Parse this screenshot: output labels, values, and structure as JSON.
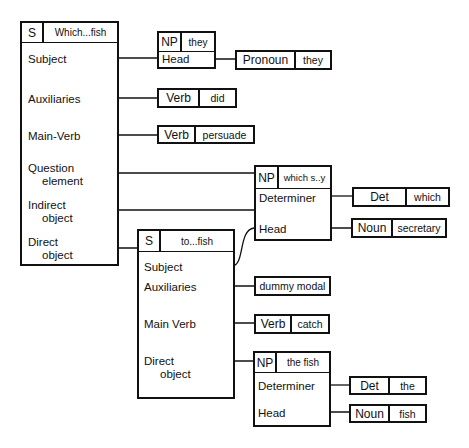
{
  "diagram": {
    "main_clause": {
      "tag": "S",
      "value": "Which...fish",
      "slots": [
        {
          "label": "Subject"
        },
        {
          "label": "Auxiliaries"
        },
        {
          "label": "Main-Verb"
        },
        {
          "label_line1": "Question",
          "label_line2": "element"
        },
        {
          "label_line1": "Indirect",
          "label_line2": "object"
        },
        {
          "label_line1": "Direct",
          "label_line2": "object"
        }
      ]
    },
    "np_they": {
      "tag": "NP",
      "value": "they",
      "slot": "Head",
      "filler": {
        "category": "Pronoun",
        "word": "they"
      }
    },
    "aux_filler": {
      "category": "Verb",
      "word": "did"
    },
    "main_verb_filler": {
      "category": "Verb",
      "word": "persuade"
    },
    "np_which": {
      "tag": "NP",
      "value": "which s..y",
      "slots": [
        {
          "label": "Determiner",
          "filler": {
            "category": "Det",
            "word": "which"
          }
        },
        {
          "label": "Head",
          "filler": {
            "category": "Noun",
            "word": "secretary"
          }
        }
      ]
    },
    "sub_clause": {
      "tag": "S",
      "value": "to...fish",
      "slots": [
        {
          "label": "Subject"
        },
        {
          "label": "Auxiliaries",
          "filler": "dummy modal"
        },
        {
          "label": "Main Verb",
          "filler": {
            "category": "Verb",
            "word": "catch"
          }
        },
        {
          "label_line1": "Direct",
          "label_line2": "object"
        }
      ]
    },
    "np_fish": {
      "tag": "NP",
      "value": "the fish",
      "slots": [
        {
          "label": "Determiner",
          "filler": {
            "category": "Det",
            "word": "the"
          }
        },
        {
          "label": "Head",
          "filler": {
            "category": "Noun",
            "word": "fish"
          }
        }
      ]
    }
  }
}
